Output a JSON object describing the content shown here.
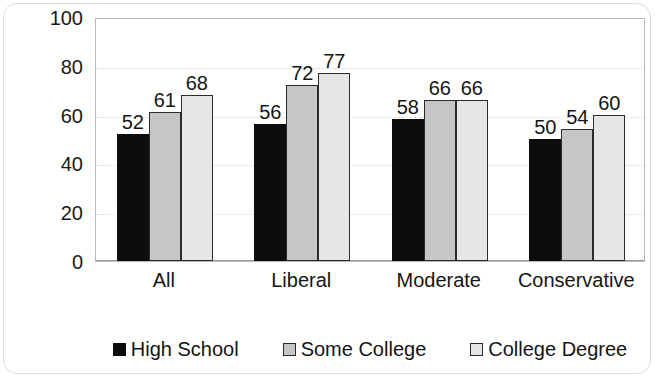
{
  "chart_data": {
    "type": "bar",
    "title": "",
    "subtitle": "",
    "xlabel": "",
    "ylabel": "",
    "categories": [
      "All",
      "Liberal",
      "Moderate",
      "Conservative"
    ],
    "series": [
      {
        "name": "High School",
        "values": [
          52,
          56,
          58,
          50
        ],
        "color": "#0d0d0d"
      },
      {
        "name": "Some College",
        "values": [
          61,
          72,
          66,
          54
        ],
        "color": "#c6c6c6"
      },
      {
        "name": "College Degree",
        "values": [
          68,
          77,
          66,
          60
        ],
        "color": "#e6e6e6"
      }
    ],
    "ylim": [
      0,
      100
    ],
    "yticks": [
      0,
      20,
      40,
      60,
      80,
      100
    ],
    "ytick_labels": [
      "0",
      "20",
      "40",
      "60",
      "80",
      "100"
    ],
    "grid": true,
    "grid_axis": "y",
    "legend_position": "bottom",
    "data_labels": true,
    "bar_border_color": "#2b2b2b",
    "plot_border_color": "#b9b9b9",
    "gridline_color": "#d8d8d8",
    "background_color": "#ffffff"
  }
}
